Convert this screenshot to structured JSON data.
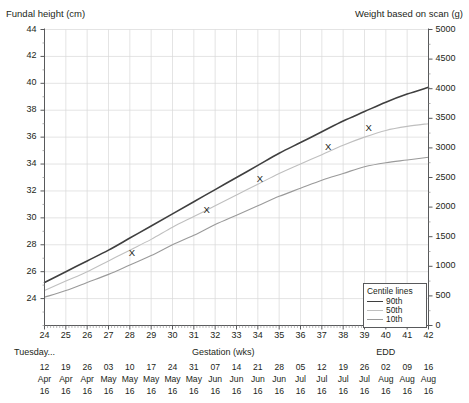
{
  "chart_data": {
    "type": "line",
    "title": "",
    "xlabel": "Gestation (wks)",
    "ylabel": "Fundal height (cm)",
    "y2label": "Weight based on scan (g)",
    "xlim": [
      24,
      42
    ],
    "ylim": [
      22,
      44
    ],
    "y2lim": [
      0,
      5000
    ],
    "grid": true,
    "legend_position": "bottom-right",
    "legend_title": "Centile lines",
    "x": [
      24,
      25,
      26,
      27,
      28,
      29,
      30,
      31,
      32,
      33,
      34,
      35,
      36,
      37,
      38,
      39,
      40,
      41,
      42
    ],
    "xtick_labels": [
      "24",
      "25",
      "26",
      "27",
      "28",
      "29",
      "30",
      "31",
      "32",
      "33",
      "34",
      "35",
      "36",
      "37",
      "38",
      "39",
      "40",
      "41",
      "42"
    ],
    "ytick_labels": [
      "24",
      "26",
      "28",
      "30",
      "32",
      "34",
      "36",
      "38",
      "40",
      "42",
      "44"
    ],
    "ytick_values": [
      24,
      26,
      28,
      30,
      32,
      34,
      36,
      38,
      40,
      42,
      44
    ],
    "y2tick_labels": [
      "0",
      "500",
      "1000",
      "1500",
      "2000",
      "2500",
      "3000",
      "3500",
      "4000",
      "4500",
      "5000"
    ],
    "y2tick_values": [
      0,
      500,
      1000,
      1500,
      2000,
      2500,
      3000,
      3500,
      4000,
      4500,
      5000
    ],
    "series": [
      {
        "name": "90th",
        "color": "#3f3f3f",
        "width": 1.6,
        "values": [
          25.2,
          26.0,
          26.8,
          27.6,
          28.5,
          29.4,
          30.3,
          31.2,
          32.1,
          33.0,
          33.9,
          34.8,
          35.6,
          36.4,
          37.2,
          37.9,
          38.6,
          39.2,
          39.7
        ]
      },
      {
        "name": "50th",
        "color": "#bfbfbf",
        "width": 1.1,
        "values": [
          24.6,
          25.3,
          26.0,
          26.8,
          27.6,
          28.4,
          29.3,
          30.1,
          30.9,
          31.7,
          32.5,
          33.3,
          34.0,
          34.7,
          35.4,
          36.0,
          36.5,
          36.8,
          37.0
        ]
      },
      {
        "name": "10th",
        "color": "#9a9a9a",
        "width": 1.1,
        "values": [
          24.1,
          24.6,
          25.2,
          25.8,
          26.5,
          27.2,
          28.0,
          28.7,
          29.5,
          30.2,
          30.9,
          31.6,
          32.2,
          32.8,
          33.3,
          33.8,
          34.1,
          34.3,
          34.5
        ]
      }
    ],
    "measurements": {
      "marker": "X",
      "points": [
        {
          "x": 28.1,
          "y": 27.4
        },
        {
          "x": 31.6,
          "y": 30.6
        },
        {
          "x": 34.1,
          "y": 32.9
        },
        {
          "x": 37.3,
          "y": 35.3
        },
        {
          "x": 39.2,
          "y": 36.7
        }
      ]
    }
  },
  "labels": {
    "left_axis_title": "Fundal height (cm)",
    "right_axis_title": "Weight based on scan (g)",
    "gestation_label": "Gestation (wks)",
    "day_label": "Tuesday...",
    "edd_label": "EDD",
    "legend_title": "Centile lines",
    "legend_entries": [
      "90th",
      "50th",
      "10th"
    ]
  },
  "dates": {
    "days": [
      "12",
      "19",
      "26",
      "03",
      "10",
      "17",
      "24",
      "31",
      "07",
      "14",
      "21",
      "28",
      "05",
      "12",
      "19",
      "26",
      "02",
      "09",
      "16"
    ],
    "months": [
      "Apr",
      "Apr",
      "Apr",
      "May",
      "May",
      "May",
      "May",
      "May",
      "Jun",
      "Jun",
      "Jun",
      "Jun",
      "Jul",
      "Jul",
      "Jul",
      "Jul",
      "Aug",
      "Aug",
      "Aug"
    ],
    "years": [
      "16",
      "16",
      "16",
      "16",
      "16",
      "16",
      "16",
      "16",
      "16",
      "16",
      "16",
      "16",
      "16",
      "16",
      "16",
      "16",
      "16",
      "16",
      "16"
    ]
  },
  "caption": {
    "text": ""
  }
}
